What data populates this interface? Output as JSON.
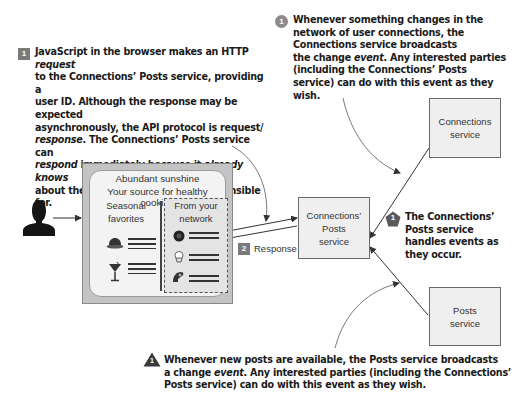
{
  "annotations": {
    "step1_request": {
      "badge": "1",
      "badge_shape": "square",
      "lines": [
        "JavaScript in the browser makes an HTTP <i>request</i>",
        "to the Connections’ Posts service, providing a",
        "user ID. Although the response may be expected",
        "asynchronously, the API protocol is request/",
        "<i>response</i>. The Connections’ Posts service can",
        "<i>respond</i> immediately because it <i>already knows</i>",
        "about the state of the data it is responsible for."
      ]
    },
    "connections_event": {
      "badge": "1",
      "badge_shape": "circle",
      "lines": [
        "Whenever something changes in the",
        "network of user connections, the",
        "Connections service broadcasts",
        "the change <i>event</i>. Any interested parties",
        "(including the Connections’ Posts",
        "service) can do with this event as they wish."
      ]
    },
    "handles_events": {
      "badge": "1",
      "badge_shape": "pentagon",
      "lines": [
        "The Connections’",
        "Posts service",
        "handles events as",
        "they occur."
      ]
    },
    "posts_event": {
      "badge": "1",
      "badge_shape": "triangle",
      "lines": [
        "Whenever new posts are available, the Posts service broadcasts",
        "a change <i>event</i>. Any interested parties (including the Connections’",
        "Posts service) can do with  this event as they wish."
      ]
    }
  },
  "browser_mockup": {
    "title_line1": "Abundant sunshine",
    "title_line2": "Your source for healthy cooking",
    "left_column": {
      "heading_line1": "Seasonal",
      "heading_line2": "favorites",
      "items": [
        "cake-icon",
        "cocktail-icon"
      ]
    },
    "right_column": {
      "heading_line1": "From your",
      "heading_line2": "network",
      "items": [
        "avatar-icon",
        "cupcake-icon",
        "pastry-icon"
      ]
    }
  },
  "services": {
    "connections_posts": {
      "line1": "Connections’",
      "line2": "Posts",
      "line3": "service"
    },
    "connections": {
      "line1": "Connections",
      "line2": "service"
    },
    "posts": {
      "line1": "Posts",
      "line2": "service"
    }
  },
  "response_step": {
    "badge": "2",
    "label": "Response"
  },
  "colors": {
    "badge_gray": "#7a7a7a",
    "service_fill": "#efefef",
    "browser_frame": "#c4c4c4",
    "text_dark": "#1a1a1a"
  }
}
